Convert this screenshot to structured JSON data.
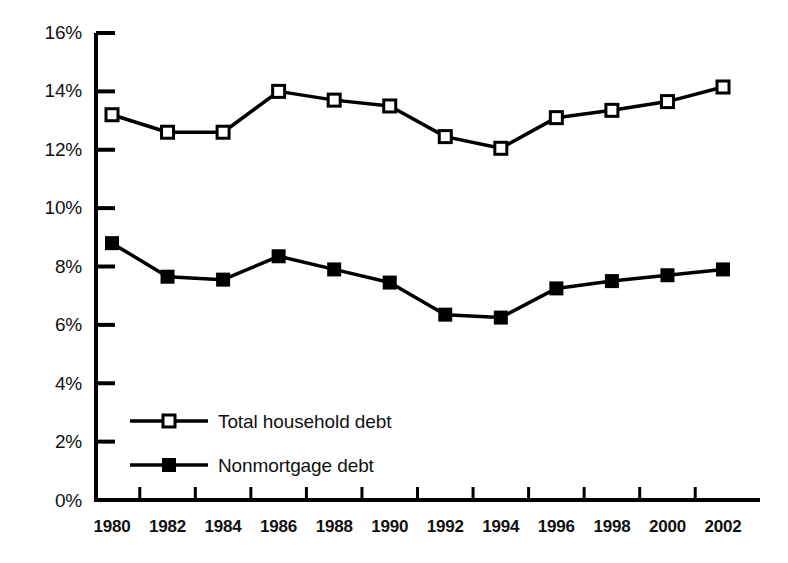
{
  "chart_data": {
    "type": "line",
    "title": "",
    "subtitle": "",
    "xlabel": "",
    "ylabel": "",
    "categories": [
      "1980",
      "1982",
      "1984",
      "1986",
      "1988",
      "1990",
      "1992",
      "1994",
      "1996",
      "1998",
      "2000",
      "2002"
    ],
    "x": [
      1980,
      1982,
      1984,
      1986,
      1988,
      1990,
      1992,
      1994,
      1996,
      1998,
      2000,
      2002
    ],
    "series": [
      {
        "name": "Total household debt",
        "marker": "open-square",
        "color": "#000000",
        "values": [
          13.2,
          12.6,
          12.6,
          14.0,
          13.7,
          13.5,
          12.45,
          12.05,
          13.1,
          13.35,
          13.65,
          14.15
        ]
      },
      {
        "name": "Nonmortgage debt",
        "marker": "filled-square",
        "color": "#000000",
        "values": [
          8.8,
          7.65,
          7.55,
          8.35,
          7.9,
          7.45,
          6.35,
          6.25,
          7.25,
          7.5,
          7.7,
          7.9
        ]
      }
    ],
    "ylim": [
      0,
      16
    ],
    "ytick_values": [
      0,
      2,
      4,
      6,
      8,
      10,
      12,
      14,
      16
    ],
    "ytick_labels": [
      "0%",
      "2%",
      "4%",
      "6%",
      "8%",
      "10%",
      "12%",
      "14%",
      "16%"
    ],
    "grid": false,
    "legend_position": "inside-lower-left",
    "units": "percent"
  },
  "axis": {
    "y_labels": [
      "16%",
      "14%",
      "12%",
      "10%",
      "8%",
      "6%",
      "4%",
      "2%",
      "0%"
    ],
    "x_labels": [
      "1980",
      "1982",
      "1984",
      "1986",
      "1988",
      "1990",
      "1992",
      "1994",
      "1996",
      "1998",
      "2000",
      "2002"
    ]
  },
  "legend": {
    "entries": [
      {
        "label": "Total household debt",
        "marker": "open-square"
      },
      {
        "label": "Nonmortgage debt",
        "marker": "filled-square"
      }
    ]
  },
  "colors": {
    "line": "#000000",
    "axis": "#000000",
    "background": "#ffffff",
    "marker_fill_open": "#ffffff",
    "marker_fill_solid": "#000000"
  }
}
